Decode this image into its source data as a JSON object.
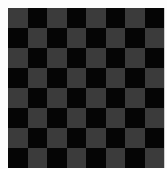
{
  "image": {
    "subject": "checkerboard",
    "rows": 8,
    "columns": 8,
    "first_square": "light",
    "colors": {
      "light_square": "#3b3b3b",
      "dark_square": "#050505",
      "background": "#fdfdfd"
    }
  }
}
